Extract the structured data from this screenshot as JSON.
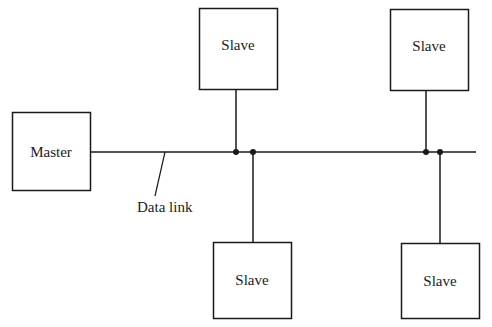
{
  "diagram": {
    "type": "master-slave bus topology",
    "colors": {
      "line": "#1a1a1a",
      "text": "#222222",
      "background": "#ffffff"
    },
    "nodes": {
      "master": {
        "label": "Master"
      },
      "slave_top_left": {
        "label": "Slave"
      },
      "slave_top_right": {
        "label": "Slave"
      },
      "slave_bottom_left": {
        "label": "Slave"
      },
      "slave_bottom_right": {
        "label": "Slave"
      }
    },
    "bus": {
      "label": "Data link"
    }
  }
}
